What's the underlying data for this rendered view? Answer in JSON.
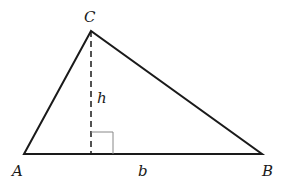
{
  "diagram": {
    "vertices": [
      {
        "label": "A",
        "x": 24,
        "y": 154,
        "lx": 12,
        "ly": 176
      },
      {
        "label": "B",
        "x": 262,
        "y": 154,
        "lx": 262,
        "ly": 176
      },
      {
        "label": "C",
        "x": 91,
        "y": 31,
        "lx": 84,
        "ly": 22
      }
    ],
    "altitude": {
      "label": "h",
      "lx": 97,
      "ly": 103
    },
    "base": {
      "label": "b",
      "lx": 138,
      "ly": 176
    },
    "colors": {
      "stroke": "#1a1a1a",
      "right_angle": "#888888"
    }
  }
}
